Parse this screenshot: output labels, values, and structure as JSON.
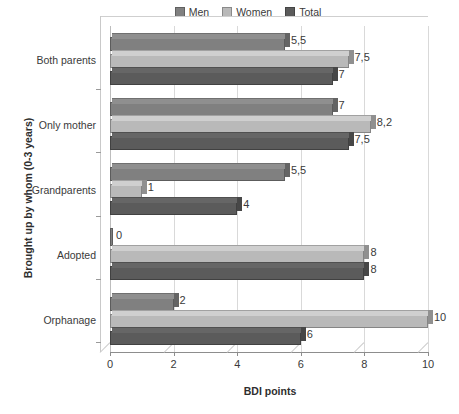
{
  "chart_data": {
    "type": "bar",
    "orientation": "horizontal",
    "title": "",
    "xlabel": "BDI points",
    "ylabel": "Brought up by whom (0-3 years)",
    "categories": [
      "Both parents",
      "Only mother",
      "Grandparents",
      "Adopted",
      "Orphanage"
    ],
    "series": [
      {
        "name": "Men",
        "color": "#808080",
        "values": [
          5.5,
          7,
          5.5,
          0,
          2
        ],
        "labels": [
          "5,5",
          "7",
          "5,5",
          "0",
          "2"
        ]
      },
      {
        "name": "Women",
        "color": "#b9b9b9",
        "values": [
          7.5,
          8.2,
          1,
          8,
          10
        ],
        "labels": [
          "7,5",
          "8,2",
          "1",
          "8",
          "10"
        ]
      },
      {
        "name": "Total",
        "color": "#5b5b5b",
        "values": [
          7,
          7.5,
          4,
          8,
          6
        ],
        "labels": [
          "7",
          "7,5",
          "4",
          "8",
          "6"
        ]
      }
    ],
    "xticks": [
      "0",
      "2",
      "4",
      "6",
      "8",
      "10"
    ],
    "xlim": [
      0,
      10
    ],
    "grid": true,
    "legend_position": "top-center",
    "style": "3d-bar"
  },
  "legend": {
    "items": [
      {
        "label": "Men",
        "color": "#808080"
      },
      {
        "label": "Women",
        "color": "#b9b9b9"
      },
      {
        "label": "Total",
        "color": "#5b5b5b"
      }
    ]
  },
  "axes": {
    "x_title": "BDI points",
    "y_title": "Brought up by whom (0-3 years)"
  }
}
